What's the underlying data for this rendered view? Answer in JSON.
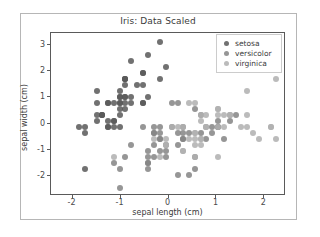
{
  "figure": {
    "title": "Iris: Data Scaled",
    "background": "#ffffff",
    "frame_color": "#b6b6b6"
  },
  "axes": {
    "xlabel": "sepal length (cm)",
    "ylabel": "sepal width (cm)",
    "xticks": [
      "-2",
      "-1",
      "0",
      "1",
      "2"
    ],
    "yticks": [
      "3",
      "2",
      "1",
      "0",
      "-1",
      "-2"
    ]
  },
  "legend": {
    "entries": [
      {
        "label": "setosa",
        "color": "#5a5a5a"
      },
      {
        "label": "versicolor",
        "color": "#858585"
      },
      {
        "label": "virginica",
        "color": "#b0b0b0"
      }
    ]
  },
  "chart_data": {
    "type": "scatter",
    "title": "Iris: Data Scaled",
    "xlabel": "sepal length (cm)",
    "ylabel": "sepal width (cm)",
    "xlim": [
      -2.45,
      2.45
    ],
    "ylim": [
      -2.75,
      3.45
    ],
    "xticks": [
      -2,
      -1,
      0,
      1,
      2
    ],
    "yticks": [
      3,
      2,
      1,
      0,
      -1,
      -2
    ],
    "grid": false,
    "legend_position": "upper right",
    "marker": "circle",
    "marker_size": 6,
    "series": [
      {
        "name": "setosa",
        "color": "#5a5a5a",
        "points": [
          [
            -0.9,
            1.02
          ],
          [
            -1.14,
            -0.13
          ],
          [
            -1.38,
            0.33
          ],
          [
            -1.5,
            0.1
          ],
          [
            -1.02,
            1.25
          ],
          [
            -0.54,
            1.94
          ],
          [
            -1.5,
            0.79
          ],
          [
            -1.02,
            0.79
          ],
          [
            -1.75,
            -0.36
          ],
          [
            -1.14,
            0.1
          ],
          [
            -0.54,
            1.48
          ],
          [
            -1.26,
            0.79
          ],
          [
            -1.26,
            -0.13
          ],
          [
            -1.87,
            -0.13
          ],
          [
            -0.05,
            2.17
          ],
          [
            -0.17,
            3.11
          ],
          [
            -0.54,
            1.94
          ],
          [
            -0.9,
            1.02
          ],
          [
            -0.17,
            1.71
          ],
          [
            -0.9,
            1.71
          ],
          [
            -0.54,
            0.79
          ],
          [
            -0.9,
            1.48
          ],
          [
            -1.5,
            1.25
          ],
          [
            -0.9,
            0.56
          ],
          [
            -1.26,
            0.79
          ],
          [
            -1.02,
            -0.13
          ],
          [
            -1.02,
            0.79
          ],
          [
            -0.78,
            1.02
          ],
          [
            -0.78,
            0.79
          ],
          [
            -1.38,
            0.33
          ],
          [
            -1.26,
            0.1
          ],
          [
            -0.54,
            0.79
          ],
          [
            -0.78,
            2.4
          ],
          [
            -0.42,
            2.63
          ],
          [
            -1.14,
            0.1
          ],
          [
            -1.02,
            0.33
          ],
          [
            -0.42,
            1.02
          ],
          [
            -1.14,
            0.79
          ],
          [
            -1.75,
            -0.13
          ],
          [
            -0.9,
            0.79
          ],
          [
            -1.02,
            1.02
          ],
          [
            -1.75,
            -1.74
          ],
          [
            -1.38,
            0.33
          ],
          [
            -1.02,
            1.02
          ],
          [
            -0.9,
            1.71
          ],
          [
            -1.26,
            -0.13
          ],
          [
            -0.9,
            1.71
          ],
          [
            -1.5,
            0.33
          ],
          [
            -0.66,
            1.48
          ],
          [
            -1.02,
            0.56
          ]
        ]
      },
      {
        "name": "versicolor",
        "color": "#858585",
        "points": [
          [
            1.4,
            0.33
          ],
          [
            0.67,
            0.33
          ],
          [
            1.28,
            0.1
          ],
          [
            -0.42,
            -1.74
          ],
          [
            0.79,
            -0.59
          ],
          [
            -0.17,
            -0.59
          ],
          [
            0.55,
            0.56
          ],
          [
            -1.14,
            -1.51
          ],
          [
            0.91,
            -0.36
          ],
          [
            -0.78,
            -0.82
          ],
          [
            -1.02,
            -2.43
          ],
          [
            0.07,
            -0.13
          ],
          [
            0.19,
            -1.97
          ],
          [
            0.31,
            -0.36
          ],
          [
            -0.3,
            -0.36
          ],
          [
            1.04,
            0.1
          ],
          [
            -0.3,
            -0.13
          ],
          [
            -0.05,
            -1.28
          ],
          [
            0.43,
            -1.97
          ],
          [
            -0.3,
            -1.28
          ],
          [
            0.07,
            0.79
          ],
          [
            0.31,
            -0.59
          ],
          [
            0.55,
            -1.28
          ],
          [
            0.31,
            -0.59
          ],
          [
            0.67,
            -0.36
          ],
          [
            0.91,
            -0.13
          ],
          [
            1.16,
            -0.59
          ],
          [
            1.04,
            -0.13
          ],
          [
            0.19,
            -0.36
          ],
          [
            -0.17,
            -1.05
          ],
          [
            -0.42,
            -1.51
          ],
          [
            -0.42,
            -1.51
          ],
          [
            -0.05,
            -0.82
          ],
          [
            0.19,
            -0.82
          ],
          [
            -0.54,
            -0.13
          ],
          [
            0.19,
            0.79
          ],
          [
            1.04,
            -0.13
          ],
          [
            0.55,
            -1.74
          ],
          [
            -0.3,
            -0.36
          ],
          [
            -0.42,
            -1.28
          ],
          [
            -0.42,
            -1.05
          ],
          [
            0.31,
            -0.13
          ],
          [
            -0.05,
            -1.05
          ],
          [
            -1.02,
            -1.74
          ],
          [
            -0.3,
            -0.82
          ],
          [
            -0.17,
            -0.13
          ],
          [
            -0.17,
            -0.36
          ],
          [
            0.43,
            -0.36
          ],
          [
            -0.9,
            -1.28
          ],
          [
            -0.17,
            -0.59
          ]
        ]
      },
      {
        "name": "virginica",
        "color": "#b0b0b0",
        "points": [
          [
            0.55,
            -0.36
          ],
          [
            -0.05,
            -0.82
          ],
          [
            1.52,
            -0.13
          ],
          [
            0.55,
            -0.36
          ],
          [
            0.79,
            -0.13
          ],
          [
            2.13,
            -0.13
          ],
          [
            -1.14,
            -1.28
          ],
          [
            1.76,
            -0.36
          ],
          [
            1.04,
            -1.28
          ],
          [
            1.64,
            1.25
          ],
          [
            0.79,
            0.33
          ],
          [
            0.67,
            -0.82
          ],
          [
            1.16,
            -0.13
          ],
          [
            -0.17,
            -1.28
          ],
          [
            -0.05,
            -0.59
          ],
          [
            0.67,
            0.33
          ],
          [
            0.79,
            -0.13
          ],
          [
            2.49,
            1.71
          ],
          [
            2.49,
            -1.05
          ],
          [
            0.31,
            -1.05
          ],
          [
            1.28,
            0.33
          ],
          [
            -0.3,
            -0.59
          ],
          [
            2.25,
            -0.59
          ],
          [
            0.55,
            -0.82
          ],
          [
            1.04,
            0.33
          ],
          [
            1.64,
            0.33
          ],
          [
            0.43,
            -0.59
          ],
          [
            0.31,
            -0.13
          ],
          [
            0.67,
            -0.59
          ],
          [
            1.64,
            -0.13
          ],
          [
            1.88,
            -0.59
          ],
          [
            2.25,
            1.71
          ],
          [
            0.67,
            -0.59
          ],
          [
            0.55,
            -0.59
          ],
          [
            0.31,
            -1.05
          ],
          [
            2.13,
            -0.13
          ],
          [
            0.55,
            0.79
          ],
          [
            0.67,
            0.1
          ],
          [
            0.19,
            -0.13
          ],
          [
            1.28,
            0.33
          ],
          [
            1.04,
            0.56
          ],
          [
            1.28,
            0.33
          ],
          [
            -0.05,
            -0.82
          ],
          [
            1.16,
            0.33
          ],
          [
            1.04,
            0.56
          ],
          [
            1.04,
            -0.13
          ],
          [
            0.55,
            -1.28
          ],
          [
            0.79,
            -0.13
          ],
          [
            0.43,
            0.79
          ],
          [
            0.07,
            -0.13
          ]
        ]
      }
    ]
  }
}
